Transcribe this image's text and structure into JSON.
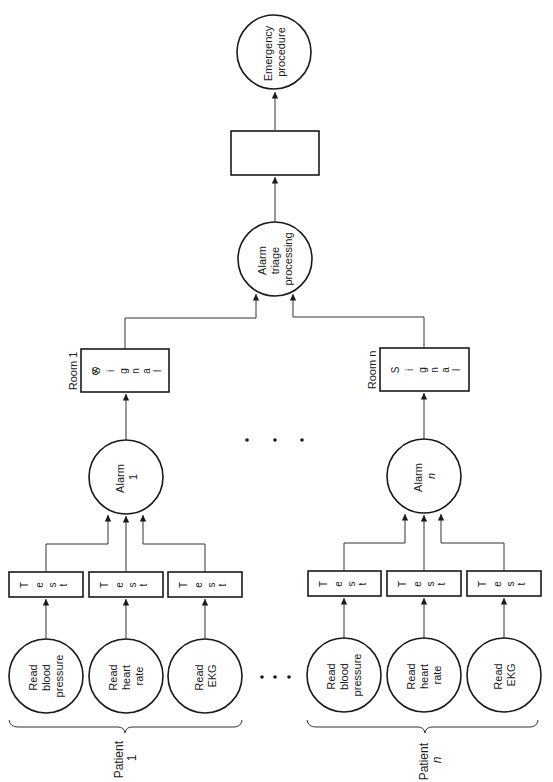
{
  "diagram": {
    "orientation": "rotated -90deg (flow runs bottom to top, text reads bottom-to-top)",
    "colors": {
      "line": "#333333",
      "text": "#1a1a1a",
      "background": "#ffffff"
    },
    "output": {
      "emergency": {
        "line1": "Emergency",
        "line2": "procedure"
      },
      "unlabeled_box": {
        "label": ""
      },
      "triage": {
        "line1": "Alarm",
        "line2": "triage",
        "line3": "processing"
      }
    },
    "rooms": [
      {
        "room_label": "Room 1",
        "signal_letters": [
          "S",
          "i",
          "g",
          "n",
          "a",
          "l"
        ],
        "alarm": {
          "line1": "Alarm",
          "line2": "1"
        },
        "patient": {
          "line1": "Patient",
          "line2": "1"
        },
        "tests": [
          {
            "letters": [
              "T",
              "e",
              "s",
              "t"
            ]
          },
          {
            "letters": [
              "T",
              "e",
              "s",
              "t"
            ]
          },
          {
            "letters": [
              "T",
              "e",
              "s",
              "t"
            ]
          }
        ],
        "readers": [
          {
            "lines": [
              "Read",
              "blood",
              "pressure"
            ]
          },
          {
            "lines": [
              "Read",
              "heart",
              "rate"
            ]
          },
          {
            "lines": [
              "Read",
              "EKG"
            ]
          }
        ]
      },
      {
        "room_label": "Room n",
        "signal_letters": [
          "S",
          "i",
          "g",
          "n",
          "a",
          "l"
        ],
        "alarm": {
          "line1": "Alarm",
          "line2": "n"
        },
        "patient": {
          "line1": "Patient",
          "line2": "n"
        },
        "tests": [
          {
            "letters": [
              "T",
              "e",
              "s",
              "t"
            ]
          },
          {
            "letters": [
              "T",
              "e",
              "s",
              "t"
            ]
          },
          {
            "letters": [
              "T",
              "e",
              "s",
              "t"
            ]
          }
        ],
        "readers": [
          {
            "lines": [
              "Read",
              "blood",
              "pressure"
            ]
          },
          {
            "lines": [
              "Read",
              "heart",
              "rate"
            ]
          },
          {
            "lines": [
              "Read",
              "EKG"
            ]
          }
        ]
      }
    ],
    "ellipsis": {
      "between_alarms": "• • •",
      "between_patients": "• • •"
    }
  }
}
